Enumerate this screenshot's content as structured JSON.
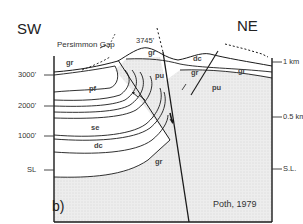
{
  "figure": {
    "panel_label": "b)",
    "credit": "Poth, 1979",
    "directions": {
      "left": "SW",
      "right": "NE"
    },
    "place_label": "Persimmon Gap",
    "peak_elevation": "3745'",
    "left_axis": {
      "ticks": [
        "3000'",
        "2000'",
        "1000'",
        "SL"
      ]
    },
    "right_axis": {
      "ticks": [
        "1 km",
        "0.5 km",
        "S.L."
      ]
    },
    "units": {
      "gr": "gr",
      "pf": "pf",
      "se": "se",
      "dc": "dc",
      "pu": "pu",
      "gr_lower": "gr",
      "gr_upper": "gr",
      "dc_upper": "dc",
      "gr_fault": "gr",
      "pu_right": "pu",
      "gr_right": "gr"
    },
    "colors": {
      "line": "#1a1a1a",
      "stipple": "#e6e6e6",
      "background": "#ffffff"
    }
  }
}
